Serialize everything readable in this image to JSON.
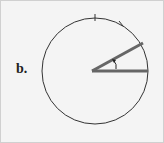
{
  "figure": {
    "label": "b.",
    "circle": {
      "cx": 90,
      "cy": 71,
      "r": 49,
      "stroke": "#333333"
    },
    "angle_rays": {
      "vertex": [
        90,
        71
      ],
      "ray1_end": [
        148,
        71
      ],
      "ray2_end": [
        143,
        43
      ],
      "color": "#666666"
    },
    "tick_marks": [
      [
        95,
        17
      ],
      [
        122,
        24
      ]
    ]
  }
}
